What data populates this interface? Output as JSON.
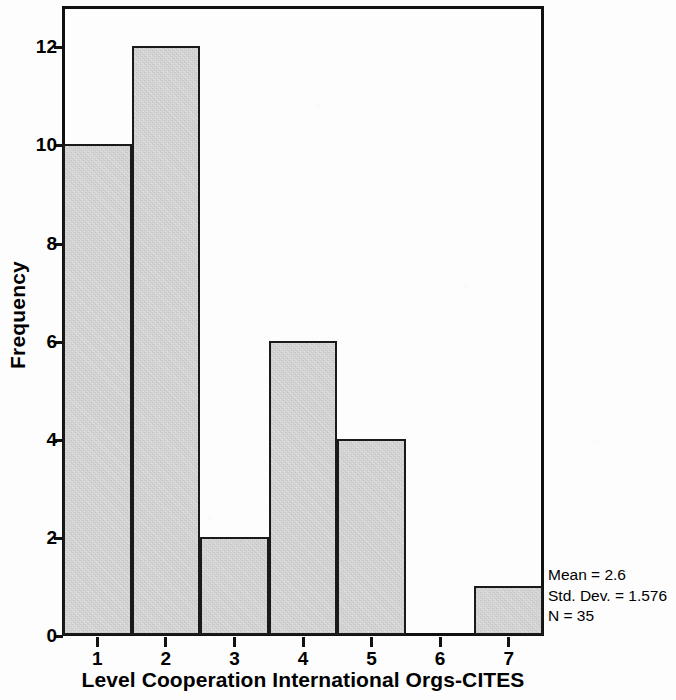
{
  "chart_data": {
    "type": "bar",
    "title": "",
    "subtitle": "",
    "xlabel": "Level Cooperation International Orgs-CITES",
    "ylabel": "Frequency",
    "categories": [
      "1",
      "2",
      "3",
      "4",
      "5",
      "6",
      "7"
    ],
    "values": [
      10,
      12,
      2,
      6,
      4,
      0,
      1
    ],
    "series": [
      {
        "name": "Frequency",
        "values": [
          10,
          12,
          2,
          6,
          4,
          0,
          1
        ]
      }
    ],
    "xlim": [
      0.5,
      7.5
    ],
    "ylim": [
      0,
      12.8
    ],
    "ytick_labels": [
      "0",
      "2",
      "4",
      "6",
      "8",
      "10",
      "12"
    ],
    "ytick_values": [
      0,
      2,
      4,
      6,
      8,
      10,
      12
    ],
    "xtick_labels": [
      "1",
      "2",
      "3",
      "4",
      "5",
      "6",
      "7"
    ],
    "grid": false,
    "legend": "none",
    "bar_fill_color": "#d6d6d6",
    "bar_edge_color": "#1a1a1a",
    "axis_color": "#111111",
    "background_color": "#fdfdfd"
  },
  "annotations": {
    "stats": {
      "mean": "Mean = 2.6",
      "std_dev": "Std. Dev. = 1.576",
      "n": "N = 35"
    }
  }
}
